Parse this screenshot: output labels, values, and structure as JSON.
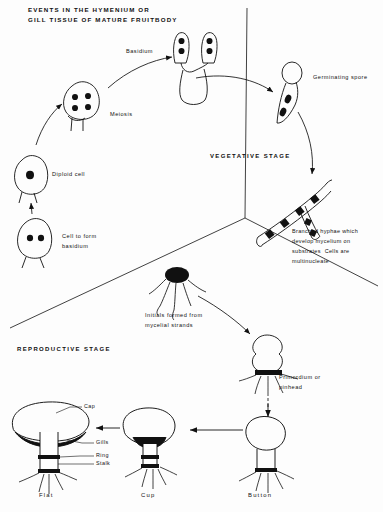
{
  "figure": {
    "title_line1": "EVENTS IN THE HYMENIUM OR",
    "title_line2": "GILL TISSUE OF MATURE FRUITBODY",
    "type": "life-cycle-diagram"
  },
  "sections": {
    "hymenium_label_line1": "EVENTS IN THE HYMENIUM OR",
    "hymenium_label_line2": "GILL TISSUE OF MATURE FRUITBODY",
    "vegetative": "VEGETATIVE STAGE",
    "reproductive": "REPRODUCTIVE STAGE"
  },
  "hymenium": {
    "basidium": "Basidium",
    "meiosis": "Meiosis",
    "diploid_cell": "Diploid cell",
    "cell_to_form_basidium_line1": "Cell to form",
    "cell_to_form_basidium_line2": "basidium"
  },
  "vegetative": {
    "germinating_spore": "Germinating spore",
    "hyphae_line1": "Branched hyphae which",
    "hyphae_line2": "develop mycelium on",
    "hyphae_line3": "substrates  Cells are",
    "hyphae_line4": "multinucleate"
  },
  "reproductive": {
    "initials_line1": "Initials formed from",
    "initials_line2": "mycelial strands",
    "primordium_line1": "Primordium or",
    "primordium_line2": "pinhead"
  },
  "fruitbody_parts": {
    "cap": "Cap",
    "gills": "Gills",
    "ring": "Ring",
    "stalk": "Stalk"
  },
  "fruitbody_stages": {
    "flat": "Flat",
    "cup": "Cup",
    "button": "Button"
  },
  "colors": {
    "ink": "#111111",
    "background": "#ffffff",
    "fill": "#000000"
  }
}
